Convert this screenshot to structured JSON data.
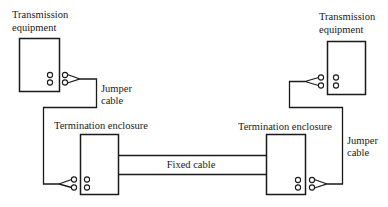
{
  "diagram": {
    "type": "cabling-diagram",
    "colors": {
      "line": "#1a1a1a",
      "background": "#ffffff"
    },
    "labels": {
      "left_equipment": [
        "Transmission",
        "equipment"
      ],
      "right_equipment": [
        "Transmission",
        "equipment"
      ],
      "left_jumper": [
        "Jumper",
        "cable"
      ],
      "right_jumper": [
        "Jumper",
        "cable"
      ],
      "left_enclosure": "Termination enclosure",
      "right_enclosure": "Termination enclosure",
      "fixed_cable": "Fixed cable"
    },
    "nodes": [
      {
        "id": "left-transmission-equipment",
        "label": "Transmission equipment"
      },
      {
        "id": "left-termination-enclosure",
        "label": "Termination enclosure"
      },
      {
        "id": "right-termination-enclosure",
        "label": "Termination enclosure"
      },
      {
        "id": "right-transmission-equipment",
        "label": "Transmission equipment"
      }
    ],
    "edges": [
      {
        "from": "left-transmission-equipment",
        "to": "left-termination-enclosure",
        "label": "Jumper cable"
      },
      {
        "from": "left-termination-enclosure",
        "to": "right-termination-enclosure",
        "label": "Fixed cable"
      },
      {
        "from": "right-termination-enclosure",
        "to": "right-transmission-equipment",
        "label": "Jumper cable"
      }
    ]
  }
}
